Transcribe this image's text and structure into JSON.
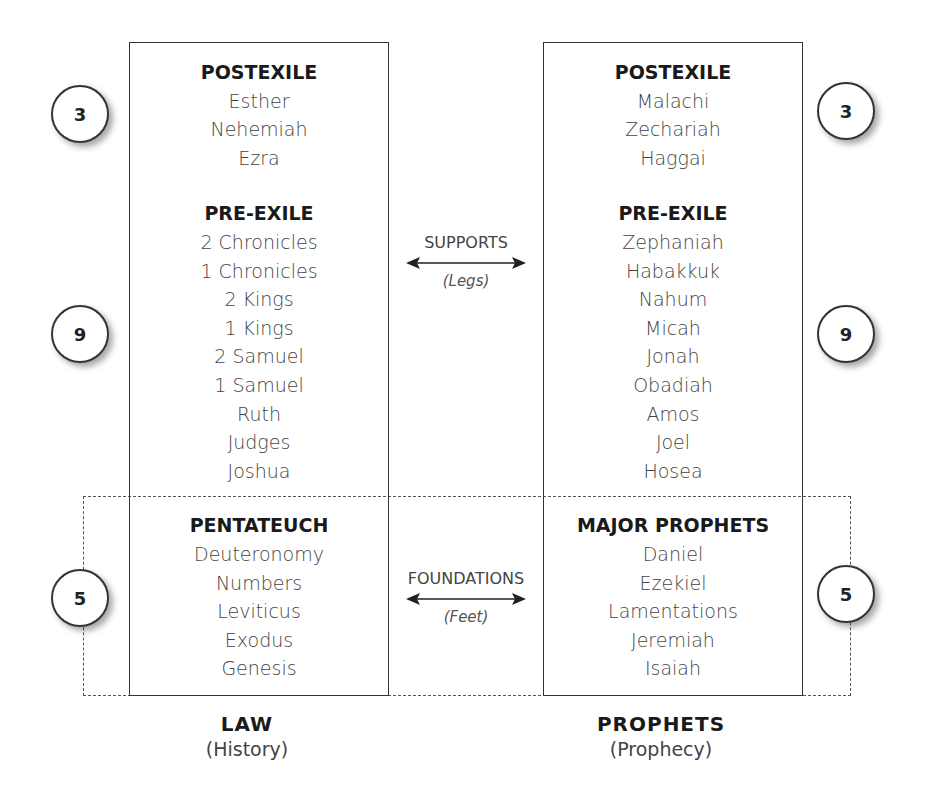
{
  "left": {
    "sections": [
      {
        "heading": "POSTEXILE",
        "items": [
          "Esther",
          "Nehemiah",
          "Ezra"
        ]
      },
      {
        "heading": "PRE-EXILE",
        "items": [
          "2 Chronicles",
          "1 Chronicles",
          "2 Kings",
          "1 Kings",
          "2 Samuel",
          "1 Samuel",
          "Ruth",
          "Judges",
          "Joshua"
        ]
      },
      {
        "heading": "PENTATEUCH",
        "items": [
          "Deuteronomy",
          "Numbers",
          "Leviticus",
          "Exodus",
          "Genesis"
        ]
      }
    ],
    "counts": [
      "3",
      "9",
      "5"
    ],
    "footer": {
      "title": "LAW",
      "subtitle": "(History)"
    }
  },
  "right": {
    "sections": [
      {
        "heading": "POSTEXILE",
        "items": [
          "Malachi",
          "Zechariah",
          "Haggai"
        ]
      },
      {
        "heading": "PRE-EXILE",
        "items": [
          "Zephaniah",
          "Habakkuk",
          "Nahum",
          "Micah",
          "Jonah",
          "Obadiah",
          "Amos",
          "Joel",
          "Hosea"
        ]
      },
      {
        "heading": "MAJOR PROPHETS",
        "items": [
          "Daniel",
          "Ezekiel",
          "Lamentations",
          "Jeremiah",
          "Isaiah"
        ]
      }
    ],
    "counts": [
      "3",
      "9",
      "5"
    ],
    "footer": {
      "title": "PROPHETS",
      "subtitle": "(Prophecy)"
    }
  },
  "middle": {
    "supports": {
      "label": "SUPPORTS",
      "sub": "(Legs)",
      "icon": "double-arrow-icon"
    },
    "foundations": {
      "label": "FOUNDATIONS",
      "sub": "(Feet)",
      "icon": "double-arrow-icon"
    }
  }
}
